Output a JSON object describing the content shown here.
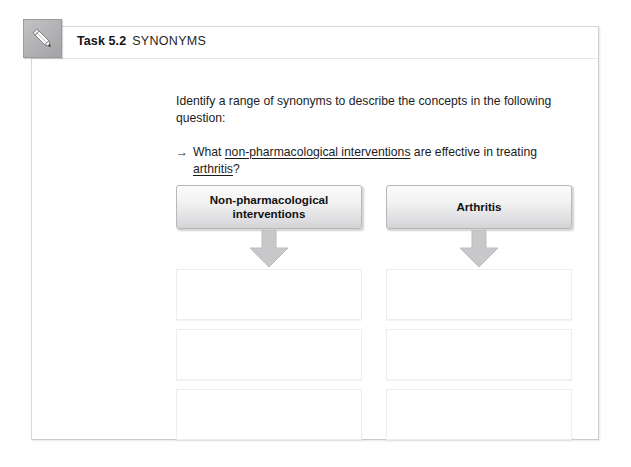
{
  "worksheet": {
    "icon": "pencil-icon",
    "task_number": "Task 5.2",
    "task_name": "SYNONYMS",
    "instruction": "Identify a range of synonyms to describe the concepts in the following question:",
    "question": {
      "bullet": "→",
      "prefix": "What ",
      "underlined_1": "non-pharmacological interventions",
      "middle": " are effective in treating ",
      "underlined_2": "arthritis",
      "suffix": "?"
    },
    "columns": [
      {
        "id": "non-pharmacological-interventions",
        "header": "Non-pharmacological interventions",
        "arrow": "down-arrow-icon",
        "answer_boxes": [
          "",
          "",
          ""
        ]
      },
      {
        "id": "arthritis",
        "header": "Arthritis",
        "arrow": "down-arrow-icon",
        "answer_boxes": [
          "",
          "",
          ""
        ]
      }
    ]
  },
  "colors": {
    "card_border": "#d9d9dc",
    "header_gradient_top": "#fbfbfb",
    "header_gradient_bottom": "#d3d3d6",
    "arrow_fill": "#c6c6c8",
    "badge_gray": "#b4b4b7",
    "text": "#1c1c1c"
  }
}
